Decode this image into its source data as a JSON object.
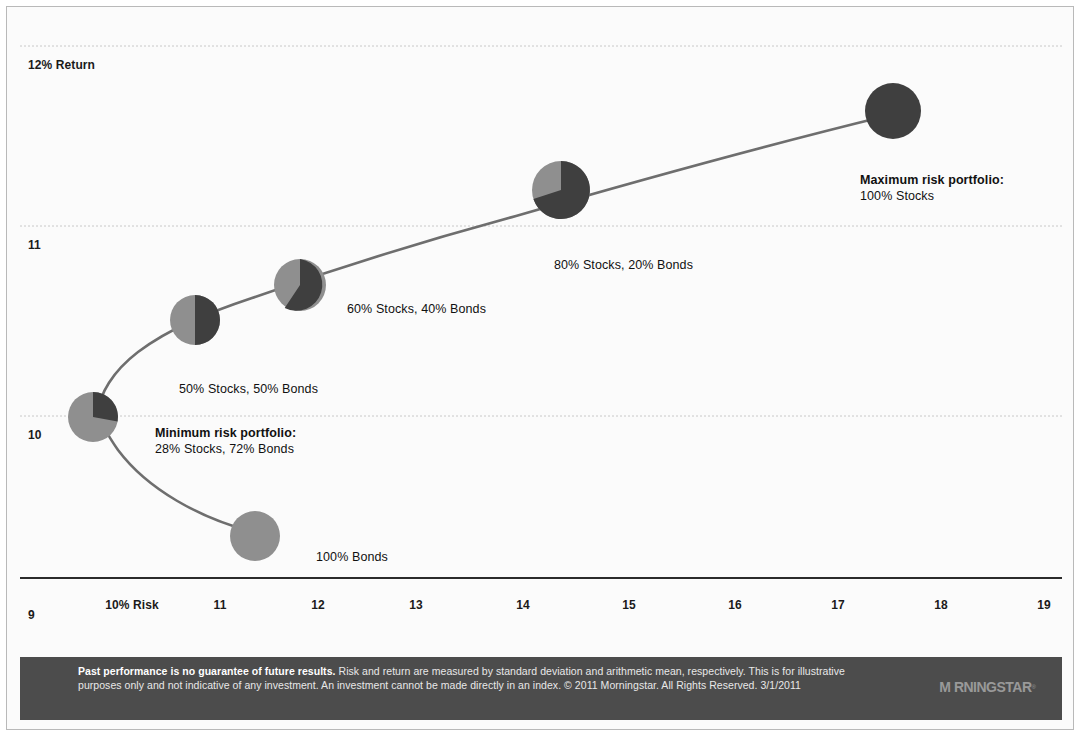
{
  "chart_data": {
    "type": "scatter",
    "title": "",
    "xlabel": "Risk",
    "ylabel": "Return",
    "xlim": [
      9.3,
      19.6
    ],
    "ylim": [
      9.0,
      12.0
    ],
    "grid": true,
    "legend_position": "none",
    "x_ticks": [
      "10% Risk",
      "11",
      "12",
      "13",
      "14",
      "15",
      "16",
      "17",
      "18",
      "19"
    ],
    "x_tick_values": [
      10,
      11,
      12,
      13,
      14,
      15,
      16,
      17,
      18,
      19
    ],
    "y_ticks": [
      "12% Return",
      "11",
      "10",
      "9"
    ],
    "y_tick_values": [
      12,
      11,
      10,
      9
    ],
    "series_name": "Efficient frontier",
    "points": [
      {
        "label": "100% Bonds",
        "stocks": 0,
        "bonds": 100,
        "risk": 11.55,
        "return": 9.47,
        "marker": "pie"
      },
      {
        "label": "Minimum risk portfolio:",
        "label2": "28% Stocks, 72% Bonds",
        "stocks": 28,
        "bonds": 72,
        "risk": 10.1,
        "return": 10.0,
        "marker": "pie",
        "emphasis": true
      },
      {
        "label": "50% Stocks, 50% Bonds",
        "stocks": 50,
        "bonds": 50,
        "risk": 11.0,
        "return": 10.47,
        "marker": "pie"
      },
      {
        "label": "60% Stocks, 40% Bonds",
        "stocks": 60,
        "bonds": 40,
        "risk": 12.0,
        "return": 10.73,
        "marker": "pie"
      },
      {
        "label": "80% Stocks, 20% Bonds",
        "stocks": 80,
        "bonds": 20,
        "risk": 14.6,
        "return": 11.18,
        "marker": "pie"
      },
      {
        "label": "Maximum risk portfolio:",
        "label2": "100% Stocks",
        "stocks": 100,
        "bonds": 0,
        "risk": 17.75,
        "return": 11.68,
        "marker": "pie",
        "emphasis": true
      }
    ],
    "colors": {
      "stocks": "#4a4a4a",
      "bonds": "#8f8f8f",
      "curve": "#6e6e6e",
      "grid": "#cfcfcf",
      "axis": "#333333",
      "background": "#fbfbfb"
    }
  },
  "axis": {
    "y_labels": [
      {
        "text": "12% Return",
        "top": 38
      },
      {
        "text": "11",
        "top": 218
      },
      {
        "text": "10",
        "top": 408
      },
      {
        "text": "9",
        "top": 588
      }
    ],
    "x_labels": [
      {
        "text": "10% Risk",
        "left": 112
      },
      {
        "text": "11",
        "left": 200
      },
      {
        "text": "12",
        "left": 298
      },
      {
        "text": "13",
        "left": 396
      },
      {
        "text": "14",
        "left": 503
      },
      {
        "text": "15",
        "left": 609
      },
      {
        "text": "16",
        "left": 715
      },
      {
        "text": "17",
        "left": 818
      },
      {
        "text": "18",
        "left": 921
      },
      {
        "text": "19",
        "left": 1024
      }
    ]
  },
  "annotations": [
    {
      "line1": "Minimum risk portfolio:",
      "line2": "28% Stocks, 72% Bonds",
      "bold": true,
      "left": 135,
      "top": 405
    },
    {
      "line1": "50% Stocks, 50% Bonds",
      "line2": "",
      "bold": false,
      "left": 159,
      "top": 361
    },
    {
      "line1": "60% Stocks, 40% Bonds",
      "line2": "",
      "bold": false,
      "left": 327,
      "top": 281
    },
    {
      "line1": "80% Stocks, 20% Bonds",
      "line2": "",
      "bold": false,
      "left": 534,
      "top": 237
    },
    {
      "line1": "Maximum risk portfolio:",
      "line2": "100% Stocks",
      "bold": true,
      "left": 840,
      "top": 152
    },
    {
      "line1": "100% Bonds",
      "line2": "",
      "bold": false,
      "left": 296,
      "top": 529
    }
  ],
  "footer": {
    "lead": "Past performance is no guarantee of future results.",
    "body": " Risk and return are measured by standard deviation and arithmetic mean, respectively. This is for illustrative purposes only and not indicative of any investment. An investment cannot be made directly in an index. © 2011 Morningstar. All Rights Reserved. 3/1/2011",
    "logo": "M RNINGSTAR",
    "logo_tm": "®"
  }
}
